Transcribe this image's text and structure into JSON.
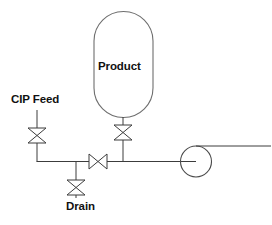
{
  "diagram": {
    "type": "process-flow-diagram",
    "background_color": "#ffffff",
    "line_color": "#3c3c3c",
    "text_color": "#111111",
    "labels": {
      "cip_feed": "CIP Feed",
      "product": "Product",
      "drain": "Drain"
    },
    "equipment": [
      {
        "id": "product-tank",
        "kind": "vessel",
        "label": "Product",
        "shape": "capsule",
        "x": 94,
        "y": 12,
        "width": 59,
        "height": 105
      },
      {
        "id": "pump",
        "kind": "centrifugal-pump",
        "shape": "circle",
        "cx": 196,
        "cy": 161,
        "r": 15.5
      }
    ],
    "valves": [
      {
        "id": "cip-feed-valve",
        "kind": "manual-valve",
        "symbol": "bowtie",
        "orientation": "vertical",
        "cx": 37,
        "cy": 135.5,
        "half_width": 9,
        "half_height": 7.5
      },
      {
        "id": "tank-outlet-valve",
        "kind": "manual-valve",
        "symbol": "bowtie",
        "orientation": "vertical",
        "cx": 123,
        "cy": 132.5,
        "half_width": 9,
        "half_height": 7.5
      },
      {
        "id": "inline-valve",
        "kind": "manual-valve",
        "symbol": "bowtie",
        "orientation": "horizontal",
        "cx": 98,
        "cy": 161,
        "half_width": 9,
        "half_height": 7.5
      },
      {
        "id": "drain-valve",
        "kind": "manual-valve",
        "symbol": "bowtie",
        "orientation": "vertical",
        "cx": 76,
        "cy": 187.5,
        "half_width": 9,
        "half_height": 7.5
      }
    ],
    "pipes": [
      {
        "id": "cip-feed-riser",
        "path": "M 37 110 L 37 128"
      },
      {
        "id": "cip-feed-downcomer",
        "path": "M 37 143 L 37 161"
      },
      {
        "id": "tank-outlet-riser",
        "path": "M 123 117 L 123 125"
      },
      {
        "id": "tank-outlet-downcomer",
        "path": "M 123 140 L 123 161"
      },
      {
        "id": "main-header-left",
        "path": "M 37 161 L 89 161"
      },
      {
        "id": "main-header-mid",
        "path": "M 107 161 L 181 161"
      },
      {
        "id": "drain-branch-upper",
        "path": "M 76 161 L 76 180"
      },
      {
        "id": "drain-branch-lower",
        "path": "M 76 195 L 76 198"
      },
      {
        "id": "pump-suction-stub",
        "path": "M 181 161 L 196 161"
      },
      {
        "id": "pump-discharge",
        "path": "M 196 146 L 271 146"
      }
    ]
  }
}
